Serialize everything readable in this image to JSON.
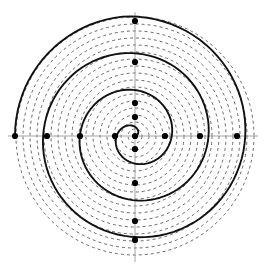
{
  "figure": {
    "kind": "archimedean-spiral-polar-diagram",
    "width": 267,
    "height": 273,
    "background_color": "#ffffff"
  },
  "colors": {
    "spiral_stroke": "#111111",
    "circle_stroke": "#444444",
    "axis_stroke": "#9a9a9a",
    "dot_fill": "#000000",
    "background": "#ffffff"
  },
  "geometry": {
    "center_x": 135,
    "center_y": 136,
    "max_radius": 123,
    "units": "pixels"
  },
  "axes": {
    "horizontal": {
      "name": "x-axis",
      "y": 136,
      "x_start": 8,
      "x_end": 258,
      "stroke_width": 0.9
    },
    "vertical": {
      "name": "y-axis",
      "x": 135,
      "y_start": 12,
      "y_end": 262,
      "stroke_width": 0.9
    }
  },
  "chart_data": {
    "type": "line",
    "xlabel": "",
    "ylabel": "",
    "grid": true,
    "legend": "none",
    "polar": true,
    "spiral": {
      "name": "archimedean-spiral",
      "equation": "r = a * theta",
      "a_per_radian": 5.85,
      "theta_start_deg": 0,
      "theta_end_deg": 1260,
      "turns": 3.5,
      "r_start": 0,
      "r_end": 120,
      "stroke_width": 1.9,
      "style": "solid",
      "sample_points_deg": 4
    },
    "dashed_circles": {
      "name": "concentric-reference-circles",
      "count": 17,
      "radius_step": 7.0,
      "radii": [
        7,
        14,
        21,
        28,
        35,
        42,
        49,
        56,
        63,
        70,
        77,
        84,
        91,
        98,
        105,
        112,
        119
      ],
      "stroke_width": 0.8,
      "dash_pattern": "3 3",
      "style": "dashed"
    },
    "marked_points": {
      "name": "spiral-axis-intersections",
      "dot_radius": 3.1,
      "axis_x_right": [
        30,
        65,
        102
      ],
      "axis_x_left": [
        20,
        55,
        88,
        120
      ],
      "axis_y_up": [
        19,
        33,
        74,
        115
      ],
      "axis_y_down": [
        13,
        47,
        85,
        104
      ],
      "center_point": true,
      "total": 15
    }
  },
  "annotations": {
    "has_labels": false,
    "has_legend": false,
    "has_tick_text": false
  }
}
